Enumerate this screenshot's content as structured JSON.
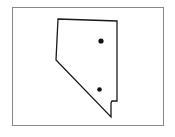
{
  "map": {
    "region": "Nevada",
    "outline_color": "#1a1a1a",
    "frame_color": "#8a8a8a",
    "points": [
      {
        "id": "city-north",
        "x": 101,
        "y": 41
      },
      {
        "id": "city-south",
        "x": 99,
        "y": 89
      }
    ],
    "outline": "58,19 117,21 117,101 112,101 111,102 111,117 56,60"
  }
}
